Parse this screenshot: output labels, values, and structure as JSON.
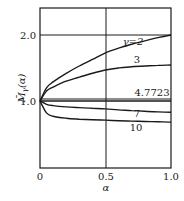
{
  "chart_data": {
    "type": "line",
    "title": "",
    "xlabel": "α",
    "ylabel": "M̄_γ(α)",
    "xlim": [
      0,
      1.0
    ],
    "ylim": [
      0,
      2.4
    ],
    "xticks": [
      "0",
      "0.5",
      "1.0"
    ],
    "yticks": [
      "1.0",
      "2.0"
    ],
    "grid": {
      "vertical": [
        0.5
      ],
      "horizontal": [
        1.0,
        2.0
      ]
    },
    "legend": "inline curve labels",
    "x": [
      0,
      0.05,
      0.1,
      0.2,
      0.3,
      0.4,
      0.5,
      0.6,
      0.7,
      0.8,
      0.9,
      1.0
    ],
    "series": [
      {
        "name": "γ=2",
        "label": "γ=2",
        "values": [
          1.0,
          1.2,
          1.29,
          1.42,
          1.53,
          1.63,
          1.73,
          1.8,
          1.86,
          1.91,
          1.96,
          2.0
        ]
      },
      {
        "name": "γ=3",
        "label": "3",
        "values": [
          1.0,
          1.15,
          1.21,
          1.3,
          1.36,
          1.42,
          1.47,
          1.5,
          1.52,
          1.53,
          1.54,
          1.545
        ]
      },
      {
        "name": "γ=4.7723",
        "label": "4.7723",
        "values": [
          1.0,
          1.0,
          1.0,
          1.0,
          1.0,
          1.0,
          1.0,
          1.0,
          1.0,
          1.0,
          1.0,
          1.0
        ]
      },
      {
        "name": "γ=7",
        "label": "7",
        "values": [
          1.0,
          0.95,
          0.93,
          0.91,
          0.9,
          0.89,
          0.88,
          0.865,
          0.855,
          0.845,
          0.835,
          0.83
        ]
      },
      {
        "name": "γ=10",
        "label": "10",
        "values": [
          1.0,
          0.82,
          0.77,
          0.74,
          0.725,
          0.715,
          0.71,
          0.7,
          0.695,
          0.69,
          0.685,
          0.68
        ]
      }
    ]
  },
  "axes": {
    "x_label": "α",
    "y_label_main": "M̄",
    "y_label_sub": "γ",
    "y_label_arg": "(α)",
    "x_ticks": [
      "0",
      "0.5",
      "1.0"
    ],
    "y_ticks": [
      "1.0",
      "2.0"
    ]
  },
  "labels": {
    "g2": "γ=2",
    "g3": "3",
    "g4": "4.7723",
    "g7": "7",
    "g10": "10"
  }
}
